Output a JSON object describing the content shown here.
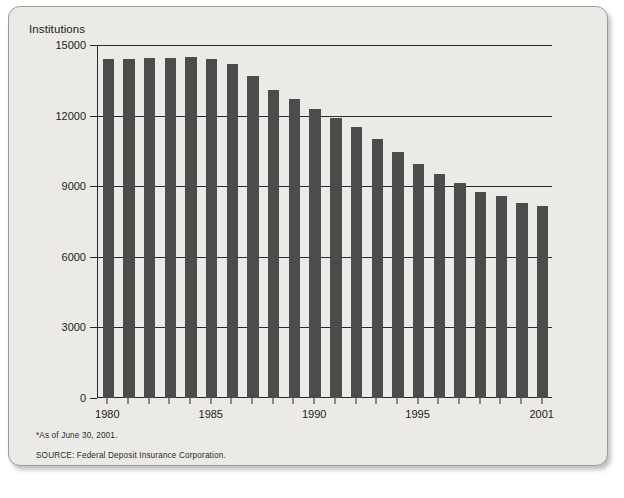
{
  "chart": {
    "title": "Institutions",
    "notes": {
      "asof": "*As of June 30, 2001.",
      "source": "SOURCE: Federal Deposit Insurance Corporation."
    }
  },
  "colors": {
    "bar": "#4c4c4c",
    "panel_background": "#eceae6",
    "axis": "#2a2a2a",
    "text": "#1b1b1b"
  },
  "chart_data": {
    "type": "bar",
    "title": "Institutions",
    "xlabel": "",
    "ylabel": "Institutions",
    "ylim": [
      0,
      15000
    ],
    "yticks": [
      0,
      3000,
      6000,
      9000,
      12000,
      15000
    ],
    "ytick_labels": [
      "0",
      "3000",
      "6000",
      "9000",
      "12000",
      "15000"
    ],
    "grid": true,
    "legend": null,
    "xtick_labels": [
      "1980",
      "1985",
      "1990",
      "1995",
      "2001"
    ],
    "labeled_years": [
      1980,
      1985,
      1990,
      1995,
      2001
    ],
    "annotations": [
      "*As of June 30, 2001.",
      "SOURCE: Federal Deposit Insurance Corporation."
    ],
    "categories": [
      "1980",
      "1981",
      "1982",
      "1983",
      "1984",
      "1985",
      "1986",
      "1987",
      "1988",
      "1989",
      "1990",
      "1991",
      "1992",
      "1993",
      "1994",
      "1995",
      "1996",
      "1997",
      "1998",
      "1999",
      "2000",
      "2001"
    ],
    "values": [
      14400,
      14400,
      14430,
      14460,
      14480,
      14400,
      14200,
      13700,
      13100,
      12700,
      12300,
      11900,
      11500,
      11000,
      10450,
      9940,
      9530,
      9140,
      8770,
      8580,
      8300,
      8150
    ]
  }
}
